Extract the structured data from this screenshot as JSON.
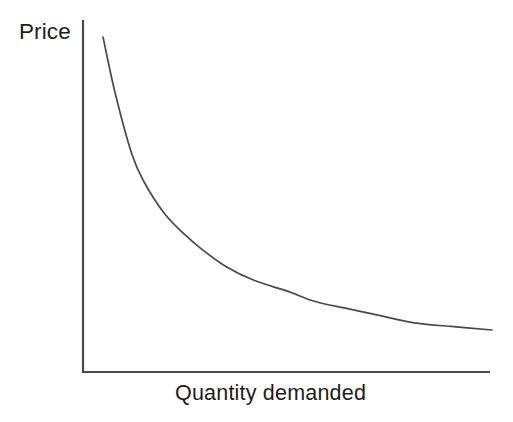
{
  "figure": {
    "type": "economics-demand-curve-diagram",
    "background_color": "#ffffff",
    "line_color": "#4a4a4a",
    "text_color": "#1d1d1d"
  },
  "chart_data": {
    "type": "line",
    "title": "",
    "subtitle": "",
    "xlabel": "Quantity demanded",
    "ylabel": "Price",
    "grid": false,
    "legend": null,
    "axis_style": "open-L-shaped, no tick marks, no tick labels, no numeric scale",
    "xlim": [
      0,
      100
    ],
    "ylim": [
      0,
      100
    ],
    "annotations": [],
    "series": [
      {
        "name": "Demand curve",
        "description": "Downward sloping convex demand curve showing inverse relationship between price and quantity demanded",
        "x": [
          5,
          8,
          12,
          15,
          20,
          25,
          29,
          35,
          42,
          50,
          57,
          65,
          73,
          81,
          90,
          100
        ],
        "y": [
          95,
          79,
          62,
          54,
          45,
          39,
          35,
          30,
          26,
          23,
          20,
          18,
          16,
          14,
          13,
          12
        ]
      }
    ]
  },
  "labels": {
    "y_axis": "Price",
    "x_axis": "Quantity demanded"
  }
}
